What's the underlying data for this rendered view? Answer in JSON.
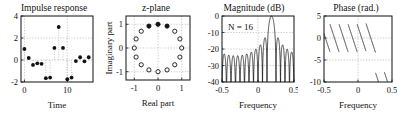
{
  "figure": {
    "panel_count": 4,
    "background": "#ffffff",
    "foreground": "#111111",
    "grid_color": "#b9b9b9"
  },
  "chart_data": [
    {
      "type": "scatter",
      "id": "impulse-response",
      "title": "Impulse response",
      "xlabel": "Time",
      "ylabel": "",
      "xlim": [
        -0.8,
        16.0
      ],
      "ylim": [
        -2,
        4
      ],
      "xticks": [
        0,
        10
      ],
      "xticklabels": [
        "0",
        "10"
      ],
      "yticks": [
        -2,
        0,
        2,
        4
      ],
      "yticklabels": [
        "-2",
        "0",
        "2",
        "4"
      ],
      "grid": true,
      "marker": "filled-circle",
      "stems": true,
      "x": [
        0,
        1,
        2,
        3,
        4,
        5,
        6,
        7,
        8,
        9,
        10,
        11,
        12,
        13,
        14,
        15
      ],
      "values": [
        1.0,
        0.18,
        -0.45,
        -0.3,
        -0.35,
        -1.65,
        -1.6,
        1.1,
        3.0,
        1.1,
        -1.75,
        -1.6,
        -0.1,
        0.25,
        -0.12,
        0.25
      ]
    },
    {
      "type": "scatter",
      "id": "z-plane",
      "title": "z-plane",
      "xlabel": "Real part",
      "ylabel": "Imaginary part",
      "xlim": [
        -1.35,
        1.35
      ],
      "ylim": [
        -1.35,
        1.35
      ],
      "xticks": [
        -1,
        0,
        1
      ],
      "xticklabels": [
        "-1",
        "0",
        "1"
      ],
      "yticks": [
        -1,
        0,
        1
      ],
      "yticklabels": [
        "-1",
        "0",
        "1"
      ],
      "grid": true,
      "marker": "open-circle",
      "zero_count": 16,
      "zeros_angles_deg": [
        0,
        22.5,
        45,
        67.5,
        90,
        112.5,
        135,
        157.5,
        180,
        202.5,
        225,
        247.5,
        270,
        292.5,
        315,
        337.5
      ],
      "zeros_radius": 1.0,
      "highlighted_zero_indices": [
        3,
        4,
        5
      ],
      "highlight_marker": "filled-circle"
    },
    {
      "type": "line",
      "id": "magnitude",
      "title": "Magnitude (dB)",
      "xlabel": "Frequency",
      "ylabel": "",
      "annotation": "N = 16",
      "annotation_N_symbol": "N",
      "annotation_N_value": "16",
      "xlim": [
        -0.5,
        0.5
      ],
      "ylim": [
        -40,
        0
      ],
      "xticks": [
        -0.5,
        0,
        0.5
      ],
      "xticklabels": [
        "-0.5",
        "0",
        "0.5"
      ],
      "yticks": [
        -40,
        -30,
        -20,
        -10,
        0
      ],
      "yticklabels": [
        "-40",
        "-30",
        "-20",
        "-10",
        "0"
      ],
      "grid": true,
      "filter_length": 16,
      "passband_center": 0.1875,
      "passband_halfwidth": 0.0625,
      "sidelobe_peak_db": -13,
      "description": "Dirichlet-kernel magnitude of a 16-tap modulated rectangular window, mainlobe centred near f = 0.19"
    },
    {
      "type": "line",
      "id": "phase",
      "title": "Phase (rad.)",
      "xlabel": "Frequency",
      "ylabel": "",
      "xlim": [
        -0.5,
        0.5
      ],
      "ylim": [
        -10,
        5
      ],
      "xticks": [
        -0.5,
        0,
        0.5
      ],
      "xticklabels": [
        "-0.5",
        "0",
        "0.5"
      ],
      "yticks": [
        -10,
        -5,
        0,
        5
      ],
      "yticklabels": [
        "-10",
        "-5",
        "0",
        "5"
      ],
      "grid": true,
      "description": "Linear phase with 2-pi wrapping producing a sawtooth; steep unwrapped drop through the passband near f = 0.19"
    }
  ]
}
